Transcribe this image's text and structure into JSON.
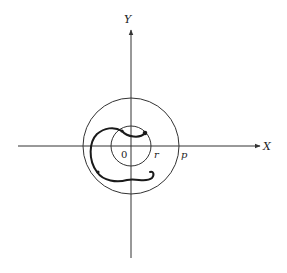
{
  "diagram": {
    "axes": {
      "x_label": "X",
      "y_label": "Y",
      "origin_label": "0"
    },
    "circles": {
      "inner_label": "r",
      "outer_label": "p"
    },
    "colors": {
      "line": "#333333",
      "curve": "#1a1a1a",
      "background": "#ffffff"
    }
  }
}
